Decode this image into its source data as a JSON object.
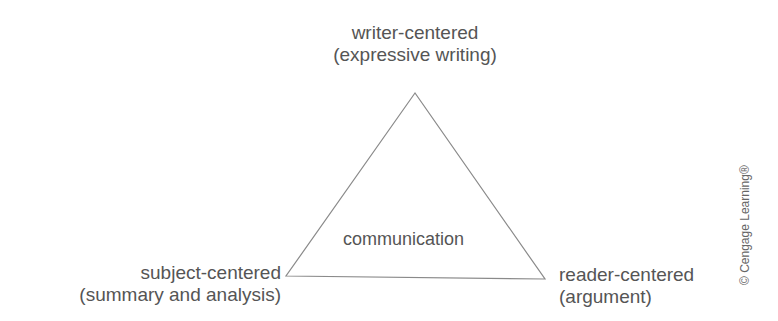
{
  "diagram": {
    "type": "rhetorical-triangle",
    "center_label": "communication",
    "vertices": {
      "top": {
        "line1": "writer-centered",
        "line2": "(expressive writing)"
      },
      "bottom_left": {
        "line1": "subject-centered",
        "line2": "(summary and analysis)"
      },
      "bottom_right": {
        "line1": "reader-centered",
        "line2": "(argument)"
      }
    },
    "copyright": "© Cengage Learning®",
    "colors": {
      "text": "#555555",
      "stroke": "#8a8a8a",
      "background": "#ffffff"
    }
  }
}
